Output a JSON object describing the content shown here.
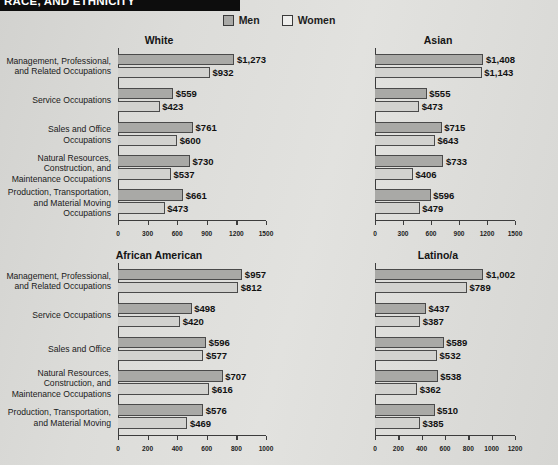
{
  "header": {
    "title": "RACE, AND ETHNICITY"
  },
  "legend": {
    "men": "Men",
    "women": "Women",
    "men_color": "#a9a9a6",
    "women_color": "#eeeeec"
  },
  "chart_data": [
    {
      "type": "bar",
      "title": "White",
      "xlabel": "",
      "ylabel": "",
      "xlim": [
        0,
        1500
      ],
      "ticks": [
        "0",
        "300",
        "600",
        "900",
        "1200",
        "1500"
      ],
      "tick_values": [
        0,
        300,
        600,
        900,
        1200,
        1500
      ],
      "grid": false,
      "legend_position": "top-center",
      "categories": [
        "Management, Professional, and Related Occupations",
        "Service Occupations",
        "Sales and Office Occupations",
        "Natural Resources, Construction, and Maintenance Occupations",
        "Production, Transportation, and Material Moving Occupations"
      ],
      "series": [
        {
          "name": "Men",
          "values": [
            1273,
            559,
            761,
            730,
            661
          ],
          "labels": [
            "$1,273",
            "$559",
            "$761",
            "$730",
            "$661"
          ]
        },
        {
          "name": "Women",
          "values": [
            932,
            423,
            600,
            537,
            473
          ],
          "labels": [
            "$932",
            "$423",
            "$600",
            "$537",
            "$473"
          ]
        }
      ]
    },
    {
      "type": "bar",
      "title": "Asian",
      "xlabel": "",
      "ylabel": "",
      "xlim": [
        0,
        1500
      ],
      "ticks": [
        "0",
        "300",
        "600",
        "900",
        "1200",
        "1500"
      ],
      "tick_values": [
        0,
        300,
        600,
        900,
        1200,
        1500
      ],
      "grid": false,
      "categories": [
        "Management, Professional, and Related Occupations",
        "Service Occupations",
        "Sales and Office Occupations",
        "Natural Resources, Construction, and Maintenance Occupations",
        "Production, Transportation, and Material Moving Occupations"
      ],
      "series": [
        {
          "name": "Men",
          "values": [
            1408,
            555,
            715,
            733,
            596
          ],
          "labels": [
            "$1,408",
            "$555",
            "$715",
            "$733",
            "$596"
          ]
        },
        {
          "name": "Women",
          "values": [
            1143,
            473,
            643,
            406,
            479
          ],
          "labels": [
            "$1,143",
            "$473",
            "$643",
            "$406",
            "$479"
          ]
        }
      ]
    },
    {
      "type": "bar",
      "title": "African American",
      "xlabel": "",
      "ylabel": "",
      "xlim": [
        0,
        1000
      ],
      "ticks": [
        "0",
        "200",
        "400",
        "600",
        "800",
        "1000"
      ],
      "tick_values": [
        0,
        200,
        400,
        600,
        800,
        1000
      ],
      "grid": false,
      "categories": [
        "Management, Professional, and Related Occupations",
        "Service Occupations",
        "Sales and Office",
        "Natural Resources, Construction, and Maintenance Occupations",
        "Production, Transportation, and Material Moving"
      ],
      "series": [
        {
          "name": "Men",
          "values": [
            957,
            498,
            596,
            707,
            576
          ],
          "labels": [
            "$957",
            "$498",
            "$596",
            "$707",
            "$576"
          ]
        },
        {
          "name": "Women",
          "values": [
            812,
            420,
            577,
            616,
            469
          ],
          "labels": [
            "$812",
            "$420",
            "$577",
            "$616",
            "$469"
          ]
        }
      ]
    },
    {
      "type": "bar",
      "title": "Latino/a",
      "xlabel": "",
      "ylabel": "",
      "xlim": [
        0,
        1200
      ],
      "ticks": [
        "0",
        "200",
        "400",
        "600",
        "800",
        "1000",
        "1200"
      ],
      "tick_values": [
        0,
        200,
        400,
        600,
        800,
        1000,
        1200
      ],
      "grid": false,
      "categories": [
        "Management, Professional, and Related Occupations",
        "Service Occupations",
        "Sales and Office",
        "Natural Resources, Construction, and Maintenance Occupations",
        "Production, Transportation, and Material Moving"
      ],
      "series": [
        {
          "name": "Men",
          "values": [
            1002,
            437,
            589,
            538,
            510
          ],
          "labels": [
            "$1,002",
            "$437",
            "$589",
            "$538",
            "$510"
          ]
        },
        {
          "name": "Women",
          "values": [
            789,
            387,
            532,
            362,
            385
          ],
          "labels": [
            "$789",
            "$387",
            "$532",
            "$362",
            "$385"
          ]
        }
      ]
    }
  ]
}
